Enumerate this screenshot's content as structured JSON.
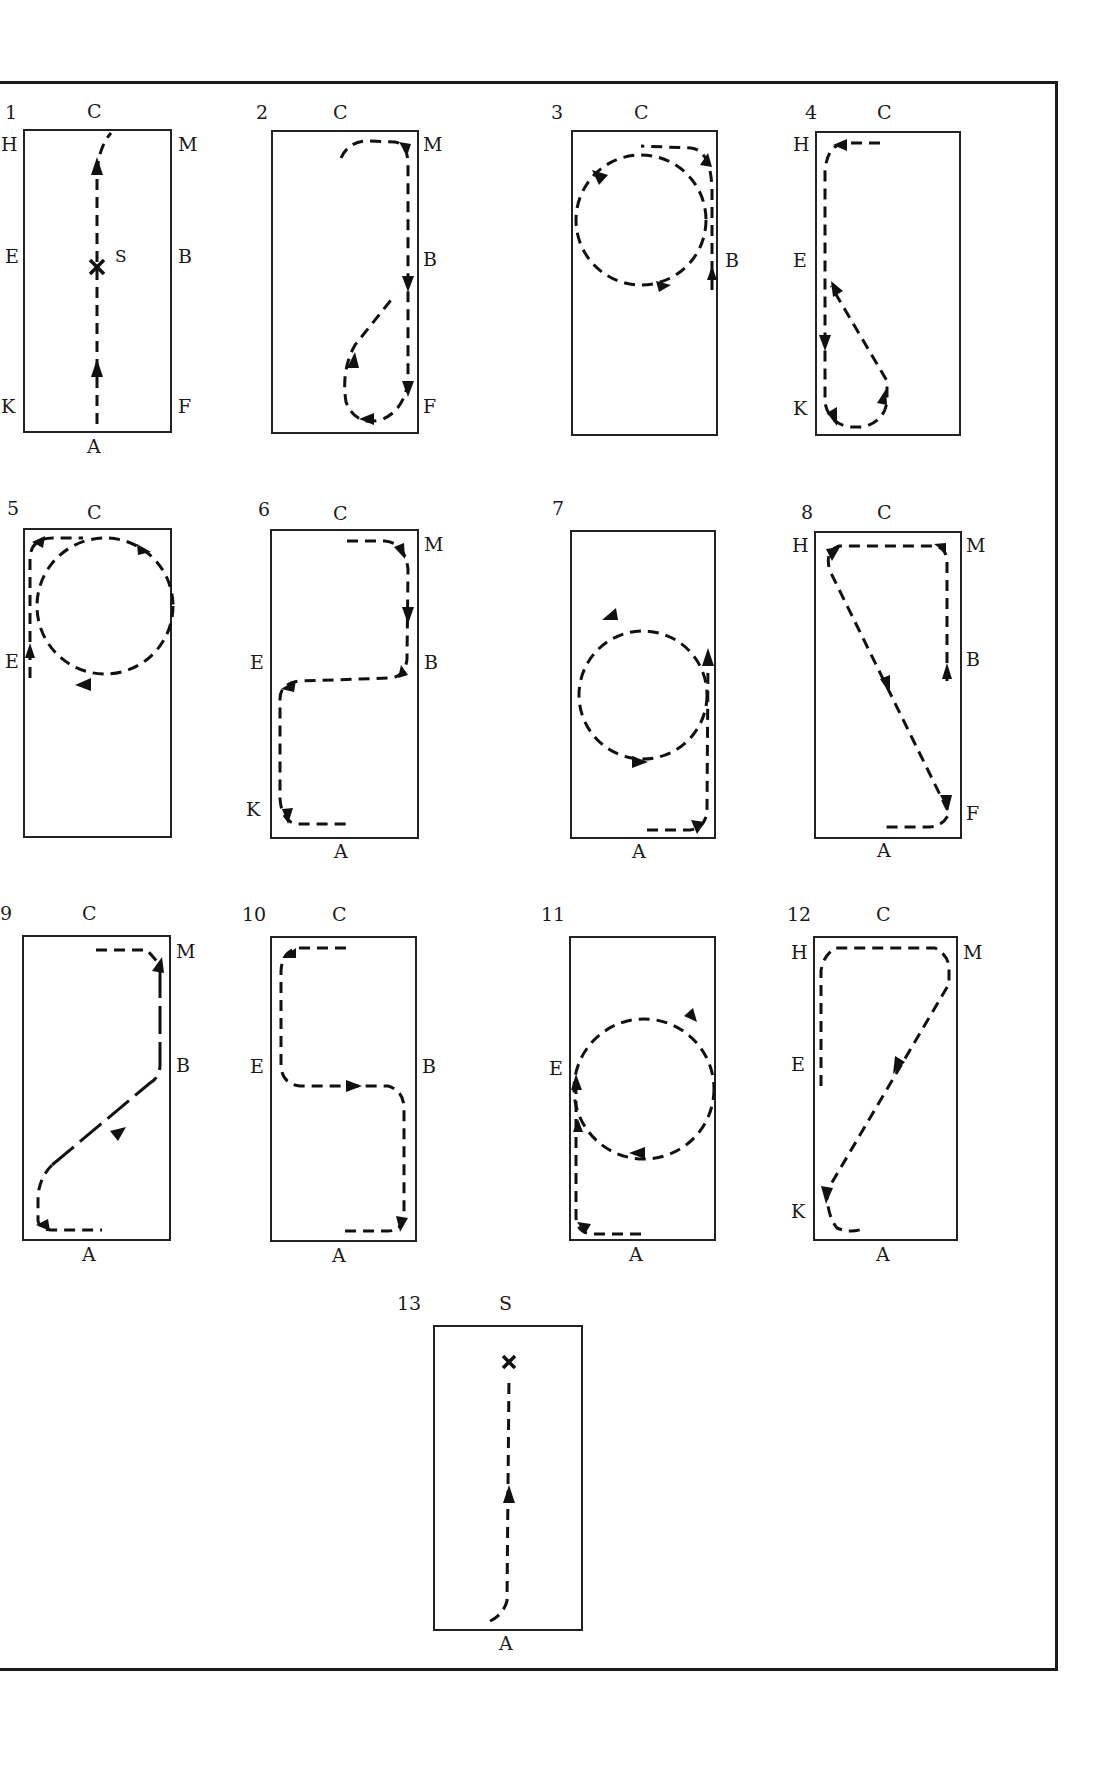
{
  "figure": {
    "arena_letters_order": [
      "A",
      "K",
      "E",
      "H",
      "C",
      "M",
      "B",
      "F"
    ],
    "marker_labels": {
      "start": "S"
    },
    "panels": [
      {
        "number": "1",
        "labels": {
          "top": "C",
          "bottom": "A",
          "left_top": "H",
          "left_mid": "E",
          "left_bottom": "K",
          "right_top": "M",
          "right_mid": "B",
          "right_bottom": "F",
          "mark": "S"
        },
        "description": "Enter at A, proceed up centre line through X (S), track right at C"
      },
      {
        "number": "2",
        "labels": {
          "top": "C",
          "right_top": "M",
          "right_mid": "B",
          "right_bottom": "F"
        },
        "description": "C to M, down long side past B to F, loop back to B"
      },
      {
        "number": "3",
        "labels": {
          "top": "C",
          "right_mid": "B"
        },
        "description": "Up from B to M, circle at C end"
      },
      {
        "number": "4",
        "labels": {
          "top": "C",
          "left_top": "H",
          "left_mid": "E",
          "left_bottom": "K"
        },
        "description": "H down long side to K, loop back to E"
      },
      {
        "number": "5",
        "labels": {
          "top": "C",
          "left_mid": "E"
        },
        "description": "E up to H, large circle at C end"
      },
      {
        "number": "6",
        "labels": {
          "top": "C",
          "right_top": "M",
          "left_mid": "E",
          "right_mid": "B",
          "left_bottom": "K",
          "bottom": "A"
        },
        "description": "M to B, across school to E, down to K, A"
      },
      {
        "number": "7",
        "labels": {
          "bottom": "A"
        },
        "description": "Circle in middle of school, return to A"
      },
      {
        "number": "8",
        "labels": {
          "top": "C",
          "left_top": "H",
          "right_top": "M",
          "right_mid": "B",
          "right_bottom": "F",
          "bottom": "A"
        },
        "description": "B to M, across to H, diagonal H to F, A"
      },
      {
        "number": "9",
        "labels": {
          "top": "C",
          "right_top": "M",
          "right_mid": "B",
          "bottom": "A"
        },
        "description": "A diagonal to B, up to M, across C"
      },
      {
        "number": "10",
        "labels": {
          "top": "C",
          "left_mid": "E",
          "right_mid": "B",
          "bottom": "A"
        },
        "description": "C to H, down to E, across to B, down to A"
      },
      {
        "number": "11",
        "labels": {
          "left_mid": "E",
          "bottom": "A"
        },
        "description": "A up to E, circle"
      },
      {
        "number": "12",
        "labels": {
          "top": "C",
          "left_top": "H",
          "right_top": "M",
          "left_mid": "E",
          "left_bottom": "K",
          "bottom": "A"
        },
        "description": "E up to H, across to M, diagonal to K, A"
      },
      {
        "number": "13",
        "labels": {
          "top": "S",
          "bottom": "A",
          "mark": "S"
        },
        "description": "Enter at A, proceed up centre line to halt at S"
      }
    ]
  }
}
